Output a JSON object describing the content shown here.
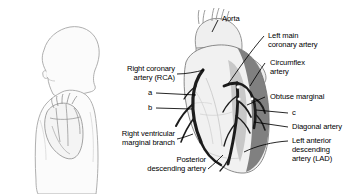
{
  "figure": {
    "background_color": "#ffffff",
    "ink_color": "#000000",
    "outline_color": "#9a9a9a",
    "heart_light_fill": "#f0f0f0",
    "heart_mid_fill": "#cfcfcf",
    "heart_dark_fill": "#6e6e6e",
    "vessel_color": "#1a1a1a"
  },
  "orientation_figures": {
    "head_profile": "head-profile-silhouette",
    "torso": "torso-silhouette",
    "inset_heart": "inset-heart-drawing"
  },
  "labels": {
    "aorta": "Aorta",
    "left_main_coronary_artery": "Left main\ncoronary artery",
    "circumflex_artery": "Circumflex\nartery",
    "obtuse_marginal": "Obtuse marginal",
    "diagonal_artery": "Diagonal artery",
    "left_anterior_descending_artery": "Left anterior\ndescending\nartery (LAD)",
    "right_coronary_artery": "Right coronary\nartery (RCA)",
    "right_ventricular_marginal_branch": "Right ventricular\nmarginal branch",
    "posterior_descending_artery": "Posterior\ndescending artery",
    "marker_a": "a",
    "marker_b": "b",
    "marker_c": "c"
  }
}
